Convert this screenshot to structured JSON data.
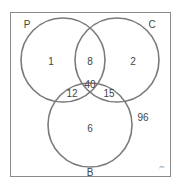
{
  "diagram": {
    "type": "venn-3",
    "colors": {
      "frame": "#8a8a8a",
      "circle": "#7a7a7a",
      "text": "#444444",
      "background": "#ffffff"
    },
    "sets": [
      {
        "id": "P",
        "label": "P"
      },
      {
        "id": "C",
        "label": "C"
      },
      {
        "id": "B",
        "label": "B"
      }
    ],
    "regions": {
      "P_only": "1",
      "C_only": "2",
      "B_only": "6",
      "P_and_C_only": "8",
      "P_and_B_only": "12",
      "C_and_B_only": "15",
      "P_and_C_and_B": "40",
      "outside": "96"
    },
    "corner_mark": "ξ"
  }
}
